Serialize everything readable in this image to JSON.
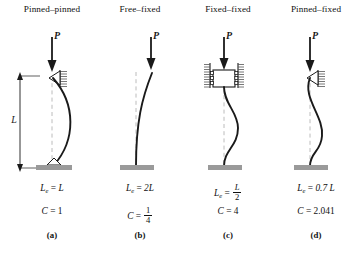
{
  "figure": {
    "type": "engineering-diagram",
    "dimension_label": "L",
    "load_label": "P",
    "colors": {
      "line": "#1a1a1a",
      "support": "#9a9a9a",
      "hatch": "#555555",
      "centerline": "#b4b4b4",
      "background": "#ffffff"
    }
  },
  "panels": [
    {
      "title": "Pinned–pinned",
      "load": "P",
      "effective_length": {
        "prefix": "L",
        "sub": "e",
        "eq": "=",
        "value": "L",
        "is_fraction": false
      },
      "constant": {
        "symbol": "C",
        "eq": "=",
        "value": "1",
        "is_fraction": false
      },
      "label": "(a)",
      "top_support": "pin-against-hatched-wall",
      "bottom_support": "pin-on-base-plate",
      "has_dimension_arrow": true
    },
    {
      "title": "Free–fixed",
      "load": "P",
      "effective_length": {
        "prefix": "L",
        "sub": "e",
        "eq": "=",
        "value": "2L",
        "is_fraction": false
      },
      "constant": {
        "symbol": "C",
        "eq": "=",
        "numerator": "1",
        "denominator": "4",
        "is_fraction": true
      },
      "label": "(b)",
      "top_support": "free",
      "bottom_support": "fixed-base-plate",
      "has_dimension_arrow": false
    },
    {
      "title": "Fixed–fixed",
      "load": "P",
      "effective_length": {
        "prefix": "L",
        "sub": "e",
        "eq": "=",
        "numerator": "L",
        "denominator": "2",
        "is_fraction": true
      },
      "constant": {
        "symbol": "C",
        "eq": "=",
        "value": "4",
        "is_fraction": false
      },
      "label": "(c)",
      "top_support": "guided-fixed-block-with-rollers",
      "bottom_support": "fixed-base-plate",
      "has_dimension_arrow": false
    },
    {
      "title": "Pinned–fixed",
      "load": "P",
      "effective_length": {
        "prefix": "L",
        "sub": "e",
        "eq": "=",
        "value": "0.7 L",
        "is_fraction": false
      },
      "constant": {
        "symbol": "C",
        "eq": "=",
        "value": "2.041",
        "is_fraction": false
      },
      "label": "(d)",
      "top_support": "pin-against-hatched-wall",
      "bottom_support": "fixed-base-plate",
      "has_dimension_arrow": false
    }
  ]
}
